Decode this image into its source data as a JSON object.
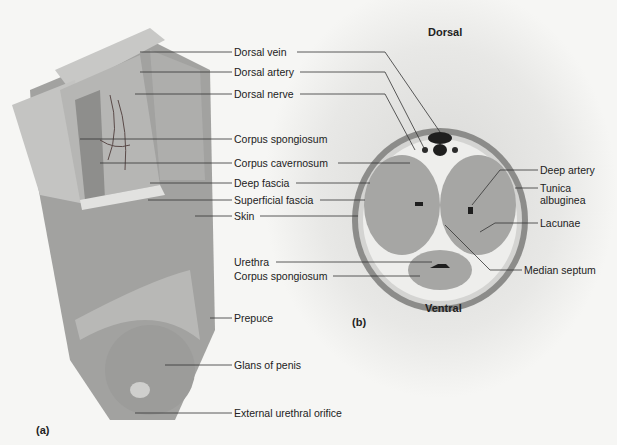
{
  "figure": {
    "panel_a_label": "(a)",
    "panel_b_label": "(b)",
    "orientation": {
      "top": "Dorsal",
      "bottom": "Ventral"
    }
  },
  "panel_a_labels": [
    {
      "text": "Dorsal vein"
    },
    {
      "text": "Dorsal artery"
    },
    {
      "text": "Dorsal nerve"
    },
    {
      "text": "Corpus spongiosum"
    },
    {
      "text": "Corpus cavernosum"
    },
    {
      "text": "Deep fascia"
    },
    {
      "text": "Superficial fascia"
    },
    {
      "text": "Skin"
    },
    {
      "text": "Urethra"
    },
    {
      "text": "Corpus spongiosum"
    },
    {
      "text": "Prepuce"
    },
    {
      "text": "Glans of penis"
    },
    {
      "text": "External urethral orifice"
    }
  ],
  "panel_b_labels": [
    {
      "text": "Deep artery"
    },
    {
      "text": "Tunica"
    },
    {
      "text": "albuginea"
    },
    {
      "text": "Lacunae"
    },
    {
      "text": "Median septum"
    }
  ],
  "colors": {
    "tissue": "#9a9a98",
    "line": "#333333",
    "background": "#f4f4f2"
  }
}
